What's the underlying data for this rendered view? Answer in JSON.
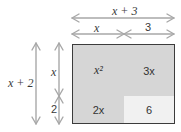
{
  "diagram": {
    "top_dimension": {
      "total_label": "x + 3",
      "parts": [
        {
          "label": "x"
        },
        {
          "label": "3"
        }
      ]
    },
    "left_dimension": {
      "total_label": "x + 2",
      "parts": [
        {
          "label": "x"
        },
        {
          "label": "2"
        }
      ]
    },
    "cells": [
      {
        "label": "x²",
        "row": 0,
        "col": 0,
        "fill": "#d6d6d6"
      },
      {
        "label": "3x",
        "row": 0,
        "col": 1,
        "fill": "#d6d6d6"
      },
      {
        "label": "2x",
        "row": 1,
        "col": 0,
        "fill": "#d6d6d6"
      },
      {
        "label": "6",
        "row": 1,
        "col": 1,
        "fill": "#f1f1f1"
      }
    ],
    "colors": {
      "arrow": "#a8a8a8",
      "border": "#3c3c3c",
      "text": "#333333"
    }
  }
}
